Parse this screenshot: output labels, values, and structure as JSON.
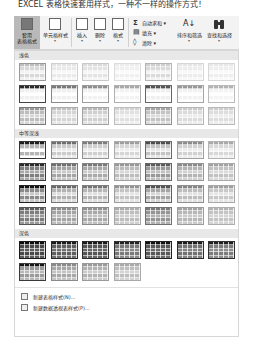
{
  "top_text": "EXCEL 表格快速套用样式，一种不一样的操作方式！",
  "ribbon": {
    "styles_group": [
      {
        "label": "套用\n表格格式",
        "caret": "▾",
        "active": true,
        "icon": "format-as-table-icon"
      },
      {
        "label": "单元格样式",
        "caret": "▾",
        "active": false,
        "icon": "cell-styles-icon"
      }
    ],
    "cells_group": [
      {
        "label": "插入",
        "caret": "▾",
        "icon": "insert-cells-icon"
      },
      {
        "label": "删除",
        "caret": "▾",
        "icon": "delete-cells-icon"
      },
      {
        "label": "格式",
        "caret": "▾",
        "icon": "format-cells-icon"
      }
    ],
    "editing_group": {
      "autosum": {
        "glyph": "Σ",
        "label": "自动求和 ▾"
      },
      "fill": {
        "glyph": "▤",
        "label": "填充 ▾"
      },
      "clear": {
        "glyph": "◊",
        "label": "清除 ▾"
      },
      "sort_filter": {
        "label": "排序和筛选",
        "caret": "▾",
        "icon": "sort-filter-icon"
      },
      "find_select": {
        "label": "查找和选择",
        "caret": "▾",
        "icon": "binoculars-icon"
      }
    }
  },
  "gallery": {
    "sections": [
      {
        "title": "浅色",
        "styles": [
          {
            "header": "#bdbdbd",
            "band": "#d8d8d8",
            "body": "#f2f2f2",
            "border": "#9a9a9a"
          },
          {
            "header": "#e4e4e4",
            "band": "#e9e9e9",
            "body": "#f7f7f7",
            "border": "#d0d0d0"
          },
          {
            "header": "#dcdcdc",
            "band": "#e3e3e3",
            "body": "#f5f5f5",
            "border": "#c8c8c8"
          },
          {
            "header": "#ececec",
            "band": "#f0f0f0",
            "body": "#fafafa",
            "border": "#dddddd"
          },
          {
            "header": "#cfcfcf",
            "band": "#dadada",
            "body": "#f3f3f3",
            "border": "#b5b5b5"
          },
          {
            "header": "#e6e6e6",
            "band": "#ececec",
            "body": "#f8f8f8",
            "border": "#d6d6d6"
          },
          {
            "header": "#e8e8e8",
            "band": "#eeeeee",
            "body": "#fafafa",
            "border": "#d8d8d8"
          },
          {
            "header": "#2b2b2b",
            "band": "#f0f0f0",
            "body": "#ffffff",
            "border": "#444444"
          },
          {
            "header": "#7a7a7a",
            "band": "#f0f0f0",
            "body": "#ffffff",
            "border": "#8a8a8a"
          },
          {
            "header": "#8e8e8e",
            "band": "#f2f2f2",
            "body": "#ffffff",
            "border": "#9c9c9c"
          },
          {
            "header": "#a8a8a8",
            "band": "#f3f3f3",
            "body": "#ffffff",
            "border": "#b0b0b0"
          },
          {
            "header": "#555555",
            "band": "#f0f0f0",
            "body": "#ffffff",
            "border": "#666666"
          },
          {
            "header": "#999999",
            "band": "#f2f2f2",
            "body": "#ffffff",
            "border": "#a5a5a5"
          },
          {
            "header": "#b3b3b3",
            "band": "#f4f4f4",
            "body": "#ffffff",
            "border": "#bbbbbb"
          },
          {
            "header": "#9a9a9a",
            "band": "#bdbdbd",
            "body": "#d6d6d6",
            "border": "#7a7a7a"
          },
          {
            "header": "#c0c0c0",
            "band": "#d5d5d5",
            "body": "#e6e6e6",
            "border": "#aaaaaa"
          },
          {
            "header": "#b8b8b8",
            "band": "#cfcfcf",
            "body": "#e2e2e2",
            "border": "#a3a3a3"
          },
          {
            "header": "#d2d2d2",
            "band": "#e0e0e0",
            "body": "#eeeeee",
            "border": "#bdbdbd"
          },
          {
            "header": "#a6a6a6",
            "band": "#c3c3c3",
            "body": "#dadada",
            "border": "#8f8f8f"
          },
          {
            "header": "#cbcbcb",
            "band": "#dbdbdb",
            "body": "#ebebeb",
            "border": "#b6b6b6"
          },
          {
            "header": "#cecece",
            "band": "#dddddd",
            "body": "#ececec",
            "border": "#b9b9b9"
          }
        ]
      },
      {
        "title": "中等深浅",
        "styles": [
          {
            "header": "#1e1e1e",
            "band": "#b5b5b5",
            "body": "#ffffff",
            "border": "#333333"
          },
          {
            "header": "#6e6e6e",
            "band": "#cbcbcb",
            "body": "#ebebeb",
            "border": "#8a8a8a"
          },
          {
            "header": "#7c7c7c",
            "band": "#cfcfcf",
            "body": "#ececec",
            "border": "#939393"
          },
          {
            "header": "#9d9d9d",
            "band": "#d6d6d6",
            "body": "#eeeeee",
            "border": "#acacac"
          },
          {
            "header": "#4e4e4e",
            "band": "#c3c3c3",
            "body": "#e8e8e8",
            "border": "#6a6a6a"
          },
          {
            "header": "#8c8c8c",
            "band": "#d2d2d2",
            "body": "#ededed",
            "border": "#a0a0a0"
          },
          {
            "header": "#a9a9a9",
            "band": "#d9d9d9",
            "body": "#f0f0f0",
            "border": "#b4b4b4"
          },
          {
            "header": "#2a2a2a",
            "band": "#7e7e7e",
            "body": "#a9a9a9",
            "border": "#3a3a3a"
          },
          {
            "header": "#707070",
            "band": "#a5a5a5",
            "body": "#c7c7c7",
            "border": "#7a7a7a"
          },
          {
            "header": "#787878",
            "band": "#a9a9a9",
            "body": "#cbcbcb",
            "border": "#838383"
          },
          {
            "header": "#979797",
            "band": "#bcbcbc",
            "body": "#d6d6d6",
            "border": "#a0a0a0"
          },
          {
            "header": "#5b5b5b",
            "band": "#999999",
            "body": "#c0c0c0",
            "border": "#666666"
          },
          {
            "header": "#8a8a8a",
            "band": "#b4b4b4",
            "body": "#d1d1d1",
            "border": "#949494"
          },
          {
            "header": "#a2a2a2",
            "band": "#c2c2c2",
            "body": "#dadada",
            "border": "#aaaaaa"
          },
          {
            "header": "#111111",
            "band": "#8a8a8a",
            "body": "#c8c8c8",
            "border": "#222222"
          },
          {
            "header": "#6a6a6a",
            "band": "#b2b2b2",
            "body": "#dddddd",
            "border": "#777777"
          },
          {
            "header": "#747474",
            "band": "#b6b6b6",
            "body": "#dfdfdf",
            "border": "#7f7f7f"
          },
          {
            "header": "#939393",
            "band": "#c4c4c4",
            "body": "#e4e4e4",
            "border": "#9d9d9d"
          },
          {
            "header": "#545454",
            "band": "#a6a6a6",
            "body": "#d6d6d6",
            "border": "#606060"
          },
          {
            "header": "#858585",
            "band": "#bdbdbd",
            "body": "#e1e1e1",
            "border": "#8f8f8f"
          },
          {
            "header": "#9f9f9f",
            "band": "#c9c9c9",
            "body": "#e6e6e6",
            "border": "#a8a8a8"
          },
          {
            "header": "#5e5e5e",
            "band": "#7d7d7d",
            "body": "#9a9a9a",
            "border": "#555555"
          },
          {
            "header": "#8d8d8d",
            "band": "#a4a4a4",
            "body": "#bcbcbc",
            "border": "#888888"
          },
          {
            "header": "#929292",
            "band": "#a9a9a9",
            "body": "#c0c0c0",
            "border": "#8c8c8c"
          },
          {
            "header": "#acacac",
            "band": "#bdbdbd",
            "body": "#cfcfcf",
            "border": "#a6a6a6"
          },
          {
            "header": "#7a7a7a",
            "band": "#959595",
            "body": "#b1b1b1",
            "border": "#727272"
          },
          {
            "header": "#a3a3a3",
            "band": "#b7b7b7",
            "body": "#cacaca",
            "border": "#9d9d9d"
          },
          {
            "header": "#b3b3b3",
            "band": "#c4c4c4",
            "body": "#d4d4d4",
            "border": "#aeaeae"
          }
        ]
      },
      {
        "title": "深色",
        "styles": [
          {
            "header": "#0d0d0d",
            "band": "#4a4a4a",
            "body": "#5c5c5c",
            "border": "#1a1a1a"
          },
          {
            "header": "#1a1a1a",
            "band": "#606060",
            "body": "#707070",
            "border": "#2a2a2a"
          },
          {
            "header": "#1a1a1a",
            "band": "#555555",
            "body": "#666666",
            "border": "#2a2a2a"
          },
          {
            "header": "#222222",
            "band": "#7a7a7a",
            "body": "#8a8a8a",
            "border": "#333333"
          },
          {
            "header": "#111111",
            "band": "#595959",
            "body": "#6b6b6b",
            "border": "#222222"
          },
          {
            "header": "#1c1c1c",
            "band": "#727272",
            "body": "#838383",
            "border": "#2c2c2c"
          },
          {
            "header": "#202020",
            "band": "#7e7e7e",
            "body": "#8f8f8f",
            "border": "#303030"
          },
          {
            "header": "#151515",
            "band": "#9a9a9a",
            "body": "#b8b8b8",
            "border": "#3a3a3a"
          },
          {
            "header": "#8a8a8a",
            "band": "#a8a8a8",
            "body": "#c3c3c3",
            "border": "#8a8a8a"
          },
          {
            "header": "#9a9a9a",
            "band": "#b3b3b3",
            "body": "#cbcbcb",
            "border": "#9a9a9a"
          },
          {
            "header": "#a9a9a9",
            "band": "#bebebe",
            "body": "#d3d3d3",
            "border": "#a9a9a9"
          }
        ]
      }
    ],
    "menu_items": [
      {
        "icon": "new-table-style-icon",
        "label": "新建表格样式(N)..."
      },
      {
        "icon": "new-pivot-style-icon",
        "label": "新建数据透视表样式(P)..."
      }
    ]
  }
}
